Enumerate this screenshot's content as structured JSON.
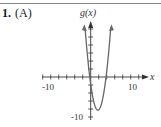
{
  "problem": {
    "number": "1.",
    "choice": "(A)"
  },
  "chart_data": {
    "type": "line",
    "title": "",
    "xlabel": "x",
    "ylabel": "g(x)",
    "x_tick_labels": [
      "-10",
      "10"
    ],
    "y_tick_labels": [
      "-10"
    ],
    "x_tick_step": 2,
    "y_tick_step": 2,
    "xlim": [
      -12,
      13
    ],
    "ylim": [
      -10,
      13
    ],
    "grid": false,
    "series": [
      {
        "name": "g(x)",
        "description": "upward-opening parabola, approx g(x)=2(x-1.8)^2-8.3",
        "x": [
          -1.4,
          -0.24,
          0,
          1,
          1.8,
          3,
          3.84,
          5
        ],
        "y": [
          12.2,
          0,
          -1.8,
          -7.0,
          -8.3,
          -5.4,
          0,
          12.2
        ]
      }
    ],
    "vertex": [
      1.8,
      -8.3
    ],
    "x_intercepts": [
      -0.24,
      3.84
    ],
    "colors": {
      "curve": "#666666",
      "axes": "#333333"
    }
  }
}
